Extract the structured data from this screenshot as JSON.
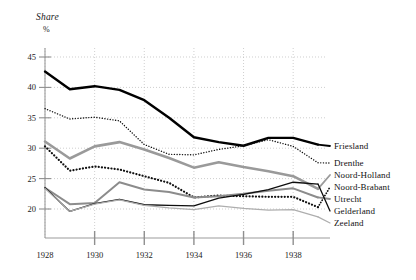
{
  "chart_data": {
    "type": "line",
    "title": "",
    "ylabel": "Share",
    "yunit": "%",
    "xlabel": "",
    "ylim": [
      18,
      46
    ],
    "xlim": [
      1928,
      1939
    ],
    "grid": true,
    "legend_position": "right",
    "yticks": [
      20,
      25,
      30,
      35,
      40,
      45
    ],
    "xticks": [
      1928,
      1930,
      1932,
      1934,
      1936,
      1938
    ],
    "x": [
      1928,
      1929,
      1930,
      1931,
      1932,
      1933,
      1934,
      1935,
      1936,
      1937,
      1938,
      1939
    ],
    "series": [
      {
        "name": "Friesland",
        "style": "solid",
        "color": "#000000",
        "width": 2.4,
        "values": [
          42.6,
          39.7,
          40.2,
          39.6,
          37.9,
          35.0,
          31.8,
          31.0,
          30.4,
          31.7,
          31.7,
          30.6
        ]
      },
      {
        "name": "Drenthe",
        "style": "dotted",
        "color": "#111111",
        "width": 1.4,
        "values": [
          36.5,
          34.8,
          35.1,
          34.5,
          30.6,
          29.0,
          28.9,
          29.8,
          30.4,
          31.4,
          30.3,
          27.6
        ]
      },
      {
        "name": "Noord-Holland",
        "style": "solid",
        "color": "#9a9a9a",
        "width": 2.6,
        "values": [
          31.1,
          28.3,
          30.3,
          31.0,
          29.8,
          28.4,
          26.8,
          27.7,
          26.9,
          26.2,
          25.4,
          23.3
        ]
      },
      {
        "name": "Noord-Brabant",
        "style": "dotted",
        "color": "#111111",
        "width": 2.2,
        "values": [
          30.3,
          26.3,
          27.0,
          26.5,
          25.4,
          24.3,
          21.9,
          22.2,
          22.1,
          22.0,
          22.0,
          20.3
        ]
      },
      {
        "name": "Utrecht",
        "style": "solid",
        "color": "#8c8c8c",
        "width": 2.0,
        "values": [
          23.5,
          20.8,
          21.0,
          24.4,
          23.2,
          22.8,
          21.9,
          22.1,
          22.5,
          23.0,
          23.4,
          21.9
        ]
      },
      {
        "name": "Gelderland",
        "style": "solid",
        "color": "#0d0d0d",
        "width": 1.3,
        "values": [
          23.5,
          19.6,
          20.9,
          21.6,
          20.7,
          20.6,
          20.5,
          21.8,
          22.4,
          23.2,
          24.4,
          24.1
        ]
      },
      {
        "name": "Zeeland",
        "style": "solid",
        "color": "#aeaeae",
        "width": 1.2,
        "values": [
          23.4,
          19.6,
          20.8,
          21.5,
          20.6,
          20.2,
          19.9,
          20.5,
          20.1,
          19.8,
          19.9,
          18.7
        ]
      }
    ]
  },
  "legend": {
    "items": [
      {
        "label": "Friesland"
      },
      {
        "label": "Drenthe"
      },
      {
        "label": "Noord-Holland"
      },
      {
        "label": "Noord-Brabant"
      },
      {
        "label": "Utrecht"
      },
      {
        "label": "Gelderland"
      },
      {
        "label": "Zeeland"
      }
    ]
  },
  "axes": {
    "y_title": "Share",
    "y_unit": "%",
    "y_tick_labels": [
      "45",
      "40",
      "35",
      "30",
      "25",
      "20"
    ],
    "x_tick_labels": [
      "1928",
      "1930",
      "1932",
      "1934",
      "1936",
      "1938"
    ]
  }
}
